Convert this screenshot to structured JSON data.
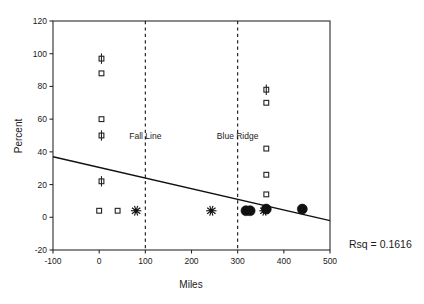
{
  "chart_data": {
    "type": "scatter",
    "title": "",
    "xlabel": "Miles",
    "ylabel": "Percent",
    "xlim": [
      -100,
      500
    ],
    "ylim": [
      -20,
      120
    ],
    "xticks": [
      -100,
      0,
      100,
      200,
      300,
      400,
      500
    ],
    "yticks": [
      -20,
      0,
      20,
      40,
      60,
      80,
      100,
      120
    ],
    "xtick_labels": [
      "-100",
      "0",
      "100",
      "200",
      "300",
      "400",
      "500"
    ],
    "ytick_labels": [
      "-20",
      "0",
      "20",
      "40",
      "60",
      "80",
      "100",
      "120"
    ],
    "grid": false,
    "legend": "none",
    "points": [
      {
        "x": 5,
        "y": 97,
        "marker": "square-bar"
      },
      {
        "x": 5,
        "y": 88,
        "marker": "square"
      },
      {
        "x": 5,
        "y": 60,
        "marker": "square"
      },
      {
        "x": 5,
        "y": 50,
        "marker": "square-bar"
      },
      {
        "x": 5,
        "y": 22,
        "marker": "square-bar"
      },
      {
        "x": 0,
        "y": 4,
        "marker": "square"
      },
      {
        "x": 40,
        "y": 4,
        "marker": "square"
      },
      {
        "x": 80,
        "y": 4,
        "marker": "star"
      },
      {
        "x": 243,
        "y": 4,
        "marker": "star"
      },
      {
        "x": 318,
        "y": 4,
        "marker": "dot"
      },
      {
        "x": 327,
        "y": 4,
        "marker": "dot"
      },
      {
        "x": 358,
        "y": 4,
        "marker": "star"
      },
      {
        "x": 362,
        "y": 5,
        "marker": "dot"
      },
      {
        "x": 362,
        "y": 14,
        "marker": "square"
      },
      {
        "x": 362,
        "y": 26,
        "marker": "square"
      },
      {
        "x": 362,
        "y": 42,
        "marker": "square"
      },
      {
        "x": 362,
        "y": 70,
        "marker": "square"
      },
      {
        "x": 362,
        "y": 78,
        "marker": "square-bar"
      },
      {
        "x": 440,
        "y": 5,
        "marker": "dot"
      }
    ],
    "regression_line": {
      "x_start": -100,
      "y_start": 37,
      "x_end": 500,
      "y_end": -2
    },
    "reference_lines": [
      {
        "x": 100,
        "label": "Fall Line",
        "style": "dashed"
      },
      {
        "x": 300,
        "label": "Blue Ridge",
        "style": "dashed"
      }
    ],
    "annotation": "Rsq = 0.1616"
  },
  "colors": {
    "axis": "#2b2b2b",
    "marker": "#111111",
    "background": "#ffffff"
  }
}
